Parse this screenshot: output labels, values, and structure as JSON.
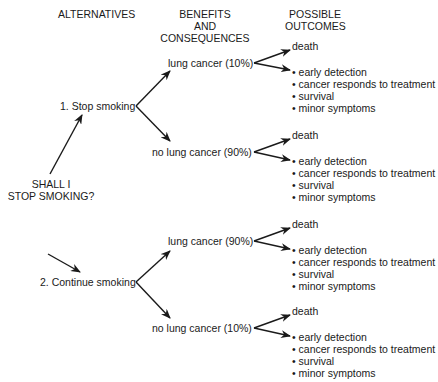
{
  "headers": {
    "alternatives": "ALTERNATIVES",
    "benefits": [
      "BENEFITS",
      "AND",
      "CONSEQUENCES"
    ],
    "outcomes": [
      "POSSIBLE",
      "OUTCOMES"
    ]
  },
  "root": {
    "lines": [
      "SHALL I",
      "STOP SMOKING?"
    ]
  },
  "alternatives": [
    {
      "label": "1. Stop smoking",
      "consequences": [
        {
          "label": "lung cancer (10%)",
          "death": "death",
          "outcomes": [
            "early detection",
            "cancer responds to treatment",
            "survival",
            "minor symptoms"
          ]
        },
        {
          "label": "no lung cancer (90%)",
          "death": "death",
          "outcomes": [
            "early detection",
            "cancer responds to treatment",
            "survival",
            "minor symptoms"
          ]
        }
      ]
    },
    {
      "label": "2. Continue smoking",
      "consequences": [
        {
          "label": "lung cancer (90%)",
          "death": "death",
          "outcomes": [
            "early detection",
            "cancer responds to treatment",
            "survival",
            "minor symptoms"
          ]
        },
        {
          "label": "no lung cancer (10%)",
          "death": "death",
          "outcomes": [
            "early detection",
            "cancer responds to treatment",
            "survival",
            "minor symptoms"
          ]
        }
      ]
    }
  ]
}
